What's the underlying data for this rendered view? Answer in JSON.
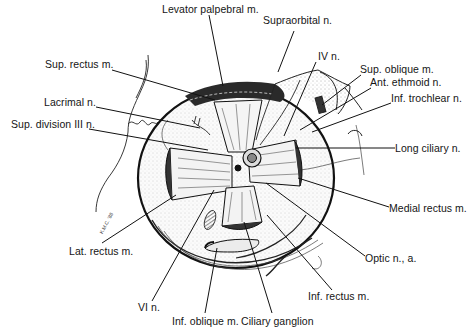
{
  "figure": {
    "signature": "K.M.C. '88",
    "colors": {
      "background": "#ffffff",
      "ink": "#111111",
      "stipple": "#bdbdbd"
    }
  },
  "labels": [
    {
      "id": "levator",
      "text": "Levator palpebral m.",
      "x": 162,
      "y": 9
    },
    {
      "id": "supraorbital",
      "text": "Supraorbital n.",
      "x": 263,
      "y": 20
    },
    {
      "id": "iv",
      "text": "IV n.",
      "x": 318,
      "y": 56
    },
    {
      "id": "sup-rectus",
      "text": "Sup. rectus m.",
      "x": 45,
      "y": 64
    },
    {
      "id": "sup-oblique",
      "text": "Sup. oblique m.",
      "x": 360,
      "y": 69
    },
    {
      "id": "ant-ethmoid",
      "text": "Ant. ethmoid n.",
      "x": 370,
      "y": 81
    },
    {
      "id": "inf-trochlear",
      "text": "Inf. trochlear n.",
      "x": 391,
      "y": 97
    },
    {
      "id": "lacrimal",
      "text": "Lacrimal n.",
      "x": 44,
      "y": 101
    },
    {
      "id": "sup-division-iii",
      "text": "Sup. division III n.",
      "x": 11,
      "y": 123
    },
    {
      "id": "long-ciliary",
      "text": "Long ciliary n.",
      "x": 395,
      "y": 142
    },
    {
      "id": "medial-rectus",
      "text": "Medial rectus m.",
      "x": 389,
      "y": 202
    },
    {
      "id": "lat-rectus",
      "text": "Lat. rectus m.",
      "x": 69,
      "y": 245
    },
    {
      "id": "optic",
      "text": "Optic n., a.",
      "x": 365,
      "y": 252
    },
    {
      "id": "inf-rectus",
      "text": "Inf. rectus m.",
      "x": 308,
      "y": 290
    },
    {
      "id": "vi",
      "text": "VI n.",
      "x": 138,
      "y": 301
    },
    {
      "id": "inf-oblique",
      "text": "Inf. oblique m.",
      "x": 172,
      "y": 315
    },
    {
      "id": "ciliary-ganglion",
      "text": "Ciliary ganglion",
      "x": 241,
      "y": 315
    }
  ]
}
